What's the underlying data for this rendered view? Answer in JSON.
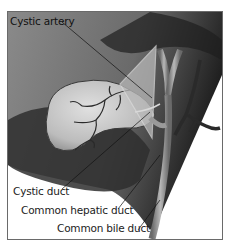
{
  "figure": {
    "type": "anatomical-illustration",
    "labels": [
      {
        "id": "cystic-artery",
        "text": "Cystic artery"
      },
      {
        "id": "cystic-duct",
        "text": "Cystic duct"
      },
      {
        "id": "common-hepatic-duct",
        "text": "Common hepatic duct"
      },
      {
        "id": "common-bile-duct",
        "text": "Common bile duct"
      }
    ],
    "colors": {
      "liver_shade": "#4a4a4a",
      "background_gray": "#7a7a7a",
      "gallbladder": "#c8c8c8",
      "vessels": "#2a2a2a",
      "ducts": "#9a9a9a",
      "highlight_triangle": "#b8b8b8",
      "frame": "#6a6a6a"
    }
  }
}
